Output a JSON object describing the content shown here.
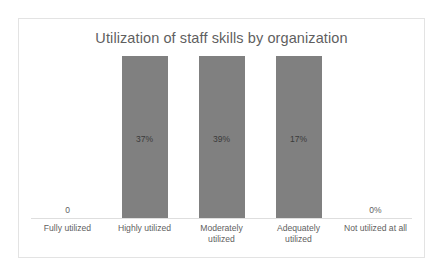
{
  "chart_data": {
    "type": "bar",
    "title": "Utilization of staff skills by organization",
    "xlabel": "",
    "ylabel": "",
    "grid": false,
    "legend": false,
    "ylim": [
      0,
      40
    ],
    "categories": [
      "Fully utilized",
      "Highly  utilized",
      "Moderately utilized",
      "Adequately utilized",
      "Not utilized at all"
    ],
    "values": [
      0,
      37,
      39,
      17,
      0
    ],
    "data_labels": [
      "0",
      "37%",
      "39%",
      "17%",
      "0%"
    ],
    "bars": [
      {
        "category_line1": "Fully utilized",
        "category_line2": "",
        "value": 0,
        "label": "0",
        "has_bar": false
      },
      {
        "category_line1": "Highly  utilized",
        "category_line2": "",
        "value": 37,
        "label": "37%",
        "has_bar": true
      },
      {
        "category_line1": "Moderately",
        "category_line2": "utilized",
        "value": 39,
        "label": "39%",
        "has_bar": true
      },
      {
        "category_line1": "Adequately",
        "category_line2": "utilized",
        "value": 17,
        "label": "17%",
        "has_bar": true
      },
      {
        "category_line1": "Not utilized at all",
        "category_line2": "",
        "value": 0,
        "label": "0%",
        "has_bar": false
      }
    ],
    "colors": {
      "bar": "#808080",
      "title_text": "#5f5f5f",
      "axis_label_text": "#5f5f5f",
      "bar_value_text": "#3a3a3a",
      "axis_line": "#dedede",
      "frame_border": "#e3e3e3",
      "background": "#ffffff"
    }
  }
}
